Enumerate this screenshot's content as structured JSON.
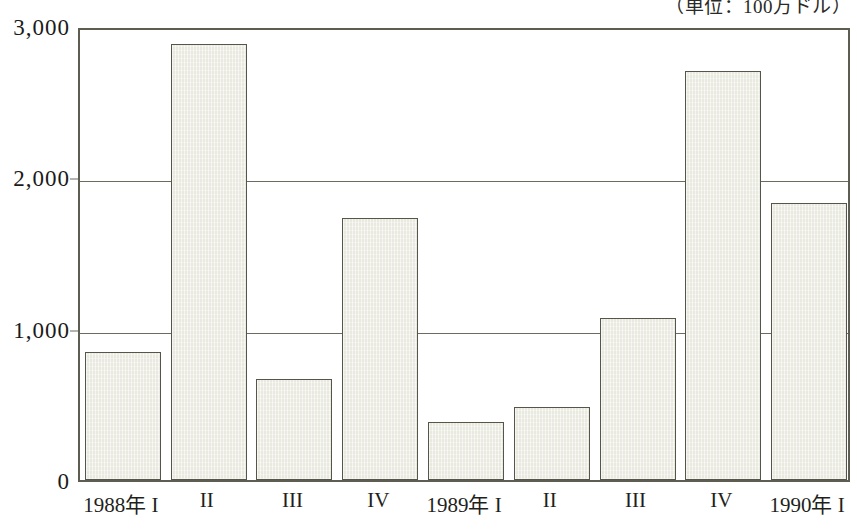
{
  "caption": {
    "unit_note": "（単位：100万ドル）"
  },
  "chart_data": {
    "type": "bar",
    "title": "",
    "subtitle": "",
    "xlabel": "",
    "ylabel": "",
    "unit_note": "（単位：100万ドル）",
    "categories": [
      "1988年 I",
      "II",
      "III",
      "IV",
      "1989年 I",
      "II",
      "III",
      "IV",
      "1990年 I"
    ],
    "values": [
      845,
      2880,
      665,
      1730,
      385,
      480,
      1070,
      2700,
      1830
    ],
    "ylim": [
      0,
      3000
    ],
    "ytick_labels": [
      "0",
      "1,000",
      "2,000",
      "3,000"
    ],
    "ytick_values": [
      0,
      1000,
      2000,
      3000
    ],
    "grid": "horizontal",
    "legend": "none",
    "bar_fill_color": "#e9e9e0",
    "bar_border_color": "#55554a",
    "axis_color": "#5d5d52",
    "background_color": "#ffffff"
  }
}
